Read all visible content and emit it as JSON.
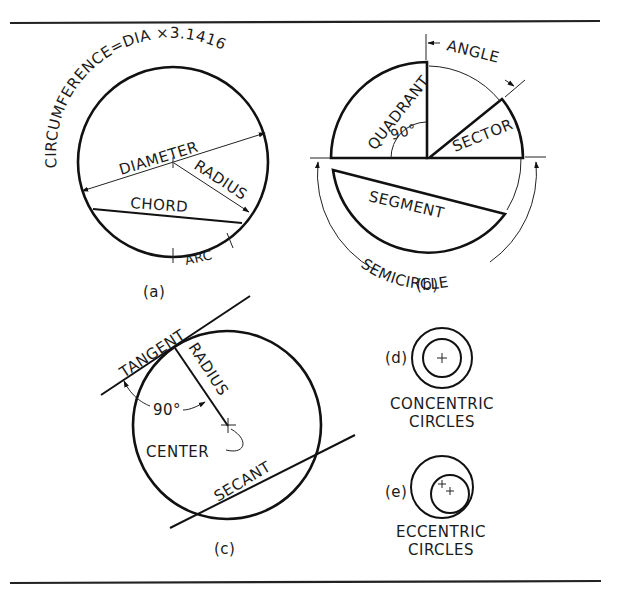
{
  "figure": {
    "panels": {
      "a": {
        "caption": "(a)",
        "circumference_label": "CIRCUMFERENCE=DIA ×3.1416",
        "diameter_label": "DIAMETER",
        "radius_label": "RADIUS",
        "chord_label": "CHORD",
        "arc_label": "ARC"
      },
      "b": {
        "caption": "(b)",
        "angle_label": "ANGLE",
        "quadrant_label": "QUADRANT",
        "right_angle_label": "90°",
        "sector_label": "SECTOR",
        "segment_label": "SEGMENT",
        "semicircle_label": "SEMICIRCLE"
      },
      "c": {
        "caption": "(c)",
        "tangent_label": "TANGENT",
        "radius_label": "RADIUS",
        "right_angle_label": "90°",
        "center_label": "CENTER",
        "secant_label": "SECANT"
      },
      "d": {
        "caption": "(d)",
        "title_line1": "CONCENTRIC",
        "title_line2": "CIRCLES"
      },
      "e": {
        "caption": "(e)",
        "title_line1": "ECCENTRIC",
        "title_line2": "CIRCLES"
      }
    }
  }
}
